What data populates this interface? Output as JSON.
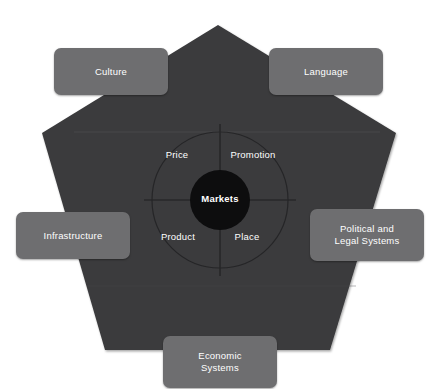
{
  "diagram": {
    "core": {
      "label": "Markets"
    },
    "quadrants": [
      {
        "id": "price",
        "label": "Price"
      },
      {
        "id": "promotion",
        "label": "Promotion"
      },
      {
        "id": "product",
        "label": "Product"
      },
      {
        "id": "place",
        "label": "Place"
      }
    ],
    "environment_boxes": [
      {
        "id": "culture",
        "label": "Culture",
        "position": "top-left"
      },
      {
        "id": "language",
        "label": "Language",
        "position": "top-right"
      },
      {
        "id": "infrastructure",
        "label": "Infrastructure",
        "position": "left"
      },
      {
        "id": "political-legal",
        "label": "Political and\nLegal Systems",
        "line1": "Political and",
        "line2": "Legal Systems",
        "position": "right"
      },
      {
        "id": "economic-systems",
        "label": "Economic\nSystems",
        "line1": "Economic",
        "line2": "Systems",
        "position": "bottom"
      }
    ]
  },
  "colors": {
    "background": "#ffffff",
    "pentagon_fill": "#3a3a3c",
    "box_fill": "#6e6e70",
    "core_fill": "#0d0d0e",
    "stroke": "#1f1f20",
    "text": "#ffffff"
  }
}
